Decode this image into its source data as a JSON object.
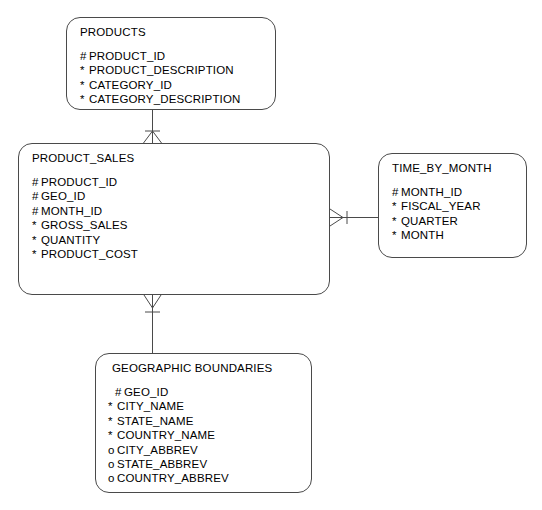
{
  "diagram": {
    "notation": "barker-crows-foot",
    "background_color": "#ffffff",
    "line_color": "#4a4a4a",
    "text_color": "#000000",
    "markers": {
      "primary_key": "#",
      "mandatory": "*",
      "optional": "o"
    },
    "entities": [
      {
        "id": "products",
        "name": "PRODUCTS",
        "attributes": [
          {
            "marker": "#",
            "name": "PRODUCT_ID"
          },
          {
            "marker": "*",
            "name": "PRODUCT_DESCRIPTION"
          },
          {
            "marker": "*",
            "name": "CATEGORY_ID"
          },
          {
            "marker": "*",
            "name": "CATEGORY_DESCRIPTION"
          }
        ]
      },
      {
        "id": "product_sales",
        "name": "PRODUCT_SALES",
        "attributes": [
          {
            "marker": "#",
            "name": "PRODUCT_ID"
          },
          {
            "marker": "#",
            "name": "GEO_ID"
          },
          {
            "marker": "#",
            "name": "MONTH_ID"
          },
          {
            "marker": "*",
            "name": "GROSS_SALES"
          },
          {
            "marker": "*",
            "name": "QUANTITY"
          },
          {
            "marker": "*",
            "name": "PRODUCT_COST"
          }
        ]
      },
      {
        "id": "time_by_month",
        "name": "TIME_BY_MONTH",
        "attributes": [
          {
            "marker": "#",
            "name": "MONTH_ID"
          },
          {
            "marker": "*",
            "name": "FISCAL_YEAR"
          },
          {
            "marker": "*",
            "name": "QUARTER"
          },
          {
            "marker": "*",
            "name": "MONTH"
          }
        ]
      },
      {
        "id": "geographic_boundaries",
        "name": "GEOGRAPHIC BOUNDARIES",
        "attributes": [
          {
            "marker": "#",
            "name": "GEO_ID"
          },
          {
            "marker": "*",
            "name": "CITY_NAME"
          },
          {
            "marker": "*",
            "name": "STATE_NAME"
          },
          {
            "marker": "*",
            "name": "COUNTRY_NAME"
          },
          {
            "marker": "o",
            "name": "CITY_ABBREV"
          },
          {
            "marker": "o",
            "name": "STATE_ABBREV"
          },
          {
            "marker": "o",
            "name": "COUNTRY_ABBREV"
          }
        ]
      }
    ],
    "relationships": [
      {
        "id": "products-to-product-sales",
        "from": "PRODUCTS",
        "to": "PRODUCT_SALES",
        "from_cardinality": "one",
        "to_cardinality": "many"
      },
      {
        "id": "product-sales-to-time-by-month",
        "from": "PRODUCT_SALES",
        "to": "TIME_BY_MONTH",
        "from_cardinality": "many",
        "to_cardinality": "one"
      },
      {
        "id": "product-sales-to-geographic-boundaries",
        "from": "PRODUCT_SALES",
        "to": "GEOGRAPHIC BOUNDARIES",
        "from_cardinality": "many",
        "to_cardinality": "one"
      }
    ]
  }
}
